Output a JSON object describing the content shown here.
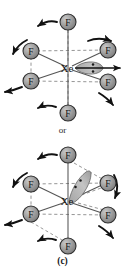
{
  "figure": {
    "label": "(c)",
    "connector_text": "or",
    "central_atom": "Xe",
    "ligand_atom": "F",
    "ligand_count": 6,
    "lone_pair_dots": 2,
    "colors": {
      "atom_fill": "#9a9a9a",
      "atom_stroke": "#2a2a2a",
      "bond": "#4a4a4a",
      "dashed_bond": "#7a7a7a",
      "arrow": "#111111",
      "lobe_fill": "#b9b9b9",
      "lobe_stroke": "#555555",
      "text": "#1a1a1a",
      "background": "#ffffff"
    }
  },
  "structures": [
    {
      "id": "top",
      "name": "xef6-structure-equatorial-lone-pair",
      "center_label": "Xe",
      "lone_pair_orientation": "horizontal-right",
      "atoms": [
        {
          "id": "f-top",
          "label": "F",
          "cx": 68,
          "cy": 22
        },
        {
          "id": "f-upper-left",
          "label": "F",
          "cx": 31,
          "cy": 51
        },
        {
          "id": "f-upper-right",
          "label": "F",
          "cx": 108,
          "cy": 50
        },
        {
          "id": "f-lower-left",
          "label": "F",
          "cx": 31,
          "cy": 81
        },
        {
          "id": "f-lower-right",
          "label": "F",
          "cx": 108,
          "cy": 82
        },
        {
          "id": "f-bottom",
          "label": "F",
          "cx": 68,
          "cy": 113
        }
      ],
      "arrows": [
        {
          "id": "arrow-top",
          "direction": "left"
        },
        {
          "id": "arrow-upper-left",
          "direction": "down-left"
        },
        {
          "id": "arrow-upper-right",
          "direction": "right"
        },
        {
          "id": "arrow-lower-left",
          "direction": "left"
        },
        {
          "id": "arrow-lower-right",
          "direction": "down-right"
        },
        {
          "id": "arrow-bottom",
          "direction": "left"
        },
        {
          "id": "arrow-lone-pair",
          "direction": "right"
        }
      ]
    },
    {
      "id": "bottom",
      "name": "xef6-structure-tilted-lone-pair",
      "center_label": "Xe",
      "lone_pair_orientation": "diagonal-upper-right",
      "atoms": [
        {
          "id": "f-top",
          "label": "F",
          "cx": 68,
          "cy": 155
        },
        {
          "id": "f-upper-left",
          "label": "F",
          "cx": 31,
          "cy": 184
        },
        {
          "id": "f-upper-right",
          "label": "F",
          "cx": 108,
          "cy": 183
        },
        {
          "id": "f-lower-left",
          "label": "F",
          "cx": 31,
          "cy": 214
        },
        {
          "id": "f-lower-right",
          "label": "F",
          "cx": 108,
          "cy": 215
        },
        {
          "id": "f-bottom",
          "label": "F",
          "cx": 68,
          "cy": 246
        }
      ],
      "arrows": [
        {
          "id": "arrow-top",
          "direction": "left"
        },
        {
          "id": "arrow-upper-left",
          "direction": "down-left"
        },
        {
          "id": "arrow-upper-right",
          "direction": "down"
        },
        {
          "id": "arrow-lower-left",
          "direction": "left"
        },
        {
          "id": "arrow-lower-right",
          "direction": "down-right"
        },
        {
          "id": "arrow-bottom",
          "direction": "left"
        }
      ]
    }
  ]
}
